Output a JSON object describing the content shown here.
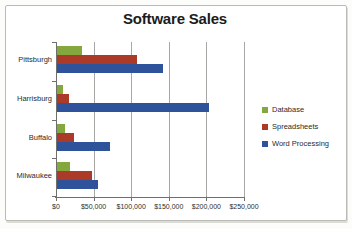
{
  "chart_data": {
    "type": "bar",
    "orientation": "horizontal",
    "title": "Software Sales",
    "categories": [
      "Pittsburgh",
      "Harrisburg",
      "Buffalo",
      "Milwaukee"
    ],
    "series": [
      {
        "name": "Database",
        "color": "#85a83e",
        "values": [
          33000,
          8000,
          11000,
          17000
        ]
      },
      {
        "name": "Spreadsheets",
        "color": "#ac3a28",
        "values": [
          107000,
          16000,
          23000,
          46000
        ]
      },
      {
        "name": "Word Processing",
        "color": "#2e539b",
        "values": [
          141000,
          202000,
          70000,
          54000
        ]
      }
    ],
    "x_axis": {
      "min": 0,
      "max": 250000,
      "tick_values": [
        0,
        50000,
        100000,
        150000,
        200000,
        250000
      ],
      "tick_labels": [
        "$0",
        "$50,000",
        "$100,000",
        "$150,000",
        "$200,000",
        "$250,000"
      ]
    },
    "grid": "vertical",
    "legend_position": "right"
  }
}
